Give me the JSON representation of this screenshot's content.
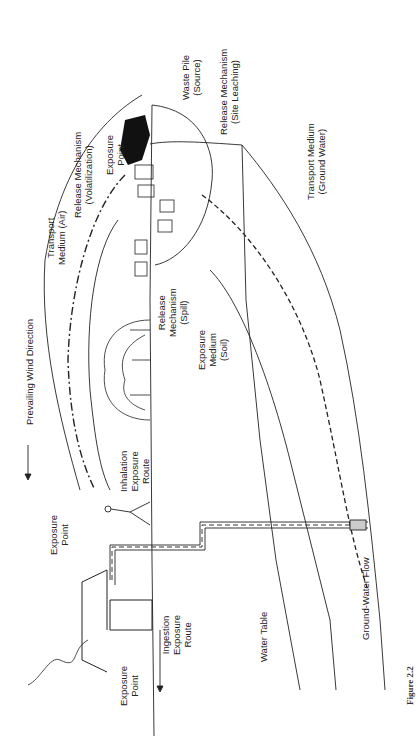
{
  "figure": {
    "caption": "Figure 2.2",
    "orientation": "rotated 90° counter-clockwise"
  },
  "labels": {
    "waste_pile": [
      "Waste Pile",
      "(Source)"
    ],
    "exposure_point_pile": [
      "Exposure",
      "Point"
    ],
    "release_volatilization": [
      "Release Mechanism",
      "(Volatilization)"
    ],
    "transport_air": [
      "Transport",
      "Medium (Air)"
    ],
    "release_leaching": [
      "Release Mechanism",
      "(Site Leaching)"
    ],
    "transport_groundwater": [
      "Transport Medium",
      "(Ground Water)"
    ],
    "prevailing_wind": "Prevailing Wind Direction",
    "release_spill": [
      "Release",
      "Mechanism",
      "(Spill)"
    ],
    "exposure_medium_soil": [
      "Exposure",
      "Medium",
      "(Soil)"
    ],
    "inhalation_route": [
      "Inhalation",
      "Exposure",
      "Route"
    ],
    "exposure_point_walker": [
      "Exposure",
      "Point"
    ],
    "exposure_point_house": [
      "Exposure",
      "Point"
    ],
    "ingestion_route": [
      "Ingestion",
      "Exposure",
      "Route"
    ],
    "water_table": "Water Table",
    "groundwater_flow": "Ground-Water Flow"
  },
  "colors": {
    "ink": "#1a1a1a",
    "paper": "#ffffff"
  }
}
